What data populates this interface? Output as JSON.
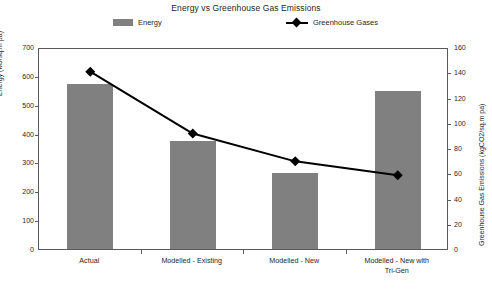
{
  "chart_data": {
    "type": "bar",
    "title": "Energy vs Greenhouse Gas Emissions",
    "categories": [
      "Actual",
      "Modelled - Existing",
      "Modelled - New",
      "Modelled - New with Tri-Gen"
    ],
    "series": [
      {
        "name": "Energy",
        "type": "bar",
        "axis": "left",
        "color": "#808080",
        "values": [
          573,
          375,
          265,
          547
        ]
      },
      {
        "name": "Greenhouse Gases",
        "type": "line",
        "axis": "right",
        "color": "#000000",
        "marker": "diamond",
        "values": [
          142,
          93,
          71,
          60
        ]
      }
    ],
    "xlabel": "",
    "ylabel": "Energy (MJ/sq.m pa)",
    "y2label": "Greenhouse Gas Emissions (kgCO2/sq.m pa)",
    "ylim": [
      0,
      700
    ],
    "y2lim": [
      0,
      160
    ],
    "yticks": [
      0,
      100,
      200,
      300,
      400,
      500,
      600,
      700
    ],
    "y2ticks": [
      0,
      20,
      40,
      60,
      80,
      100,
      120,
      140,
      160
    ],
    "grid": false,
    "legend_position": "top"
  },
  "legend": {
    "energy_label": "Energy",
    "ghg_label": "Greenhouse Gases"
  },
  "axes": {
    "left_title": "Energy (MJ/sq.m pa)",
    "right_title": "Greenhouse Gas Emissions (kgCO2/sq.m pa)",
    "left_ticks": [
      "700",
      "600",
      "500",
      "400",
      "300",
      "200",
      "100",
      "0"
    ],
    "right_ticks": [
      "160",
      "140",
      "120",
      "100",
      "80",
      "60",
      "40",
      "20",
      "0"
    ]
  },
  "categories_display": [
    {
      "line1": "Actual",
      "line2": ""
    },
    {
      "line1": "Modelled - Existing",
      "line2": ""
    },
    {
      "line1": "Modelled - New",
      "line2": ""
    },
    {
      "line1": "Modelled - New with",
      "line2": "Tri-Gen"
    }
  ]
}
